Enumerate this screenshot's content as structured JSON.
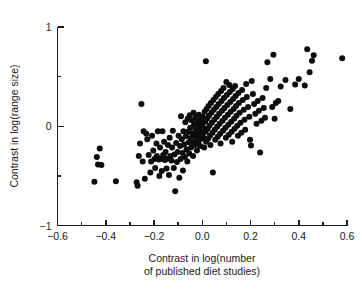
{
  "chart_data": {
    "type": "scatter",
    "title": "",
    "xlabel": "Contrast in log(number of published diet studies)",
    "xlabel_line1": "Contrast in log(number",
    "xlabel_line2": "of published diet studies)",
    "ylabel": "Contrast in log(range size)",
    "xlim": [
      -0.6,
      0.6
    ],
    "ylim": [
      -1,
      1
    ],
    "x_ticks_major": [
      -0.6,
      -0.4,
      -0.2,
      0.0,
      0.2,
      0.4,
      0.6
    ],
    "x_tick_labels": [
      "-0.6",
      "-0.4",
      "-0.2",
      "0.0",
      "0.2",
      "0.4",
      "0.6"
    ],
    "x_ticks_minor": [
      -0.5,
      -0.3,
      -0.1,
      0.1,
      0.3,
      0.5
    ],
    "y_ticks_major": [
      -1,
      0,
      1
    ],
    "y_tick_labels": [
      "-1",
      "0",
      "1"
    ],
    "y_ticks_minor": [
      -0.5,
      0.5
    ],
    "grid": false,
    "legend": false,
    "marker": "filled-circle",
    "marker_color": "#0d0d0d",
    "marker_size_px": 6,
    "point_count": 211,
    "points": [
      [
        -0.447,
        -0.56
      ],
      [
        -0.437,
        -0.31
      ],
      [
        -0.432,
        -0.385
      ],
      [
        -0.425,
        -0.225
      ],
      [
        -0.418,
        -0.39
      ],
      [
        -0.358,
        -0.555
      ],
      [
        -0.272,
        -0.565
      ],
      [
        -0.268,
        -0.6
      ],
      [
        -0.263,
        -0.3
      ],
      [
        -0.258,
        -0.175
      ],
      [
        -0.252,
        0.225
      ],
      [
        -0.247,
        -0.355
      ],
      [
        -0.243,
        -0.05
      ],
      [
        -0.238,
        -0.53
      ],
      [
        -0.232,
        -0.075
      ],
      [
        -0.228,
        -0.13
      ],
      [
        -0.222,
        -0.29
      ],
      [
        -0.215,
        -0.465
      ],
      [
        -0.212,
        -0.355
      ],
      [
        -0.208,
        -0.095
      ],
      [
        -0.203,
        -0.245
      ],
      [
        -0.198,
        -0.33
      ],
      [
        -0.195,
        -0.42
      ],
      [
        -0.19,
        -0.175
      ],
      [
        -0.188,
        -0.3
      ],
      [
        -0.184,
        -0.05
      ],
      [
        -0.18,
        -0.335
      ],
      [
        -0.178,
        -0.5
      ],
      [
        -0.175,
        -0.215
      ],
      [
        -0.172,
        -0.33
      ],
      [
        -0.168,
        -0.45
      ],
      [
        -0.165,
        -0.05
      ],
      [
        -0.162,
        -0.29
      ],
      [
        -0.158,
        -0.155
      ],
      [
        -0.155,
        -0.34
      ],
      [
        -0.152,
        -0.26
      ],
      [
        -0.148,
        -0.425
      ],
      [
        -0.145,
        -0.325
      ],
      [
        -0.142,
        -0.19
      ],
      [
        -0.138,
        -0.49
      ],
      [
        -0.135,
        -0.115
      ],
      [
        -0.132,
        -0.3
      ],
      [
        -0.128,
        -0.345
      ],
      [
        -0.125,
        -0.215
      ],
      [
        -0.122,
        -0.045
      ],
      [
        -0.118,
        -0.42
      ],
      [
        -0.115,
        -0.285
      ],
      [
        -0.112,
        -0.655
      ],
      [
        -0.108,
        -0.17
      ],
      [
        -0.105,
        -0.36
      ],
      [
        -0.102,
        -0.26
      ],
      [
        -0.098,
        -0.095
      ],
      [
        -0.095,
        -0.52
      ],
      [
        -0.092,
        -0.2
      ],
      [
        -0.09,
        -0.33
      ],
      [
        -0.088,
        0.1
      ],
      [
        -0.085,
        -0.13
      ],
      [
        -0.082,
        -0.27
      ],
      [
        -0.08,
        -0.445
      ],
      [
        -0.078,
        -0.05
      ],
      [
        -0.075,
        -0.185
      ],
      [
        -0.072,
        -0.31
      ],
      [
        -0.07,
        0.04
      ],
      [
        -0.068,
        -0.1
      ],
      [
        -0.065,
        -0.235
      ],
      [
        -0.062,
        -0.355
      ],
      [
        -0.06,
        0.075
      ],
      [
        -0.058,
        -0.055
      ],
      [
        -0.056,
        -0.16
      ],
      [
        -0.054,
        -0.275
      ],
      [
        -0.052,
        0.11
      ],
      [
        -0.05,
        -0.015
      ],
      [
        -0.048,
        -0.12
      ],
      [
        -0.046,
        -0.215
      ],
      [
        -0.044,
        0.06
      ],
      [
        -0.042,
        -0.07
      ],
      [
        -0.04,
        -0.165
      ],
      [
        -0.038,
        -0.3
      ],
      [
        -0.036,
        0.135
      ],
      [
        -0.034,
        0.015
      ],
      [
        -0.032,
        -0.09
      ],
      [
        -0.03,
        -0.19
      ],
      [
        -0.028,
        0.085
      ],
      [
        -0.026,
        -0.03
      ],
      [
        -0.024,
        -0.135
      ],
      [
        -0.022,
        -0.245
      ],
      [
        -0.02,
        0.05
      ],
      [
        -0.018,
        -0.06
      ],
      [
        -0.016,
        -0.155
      ],
      [
        -0.014,
        0.115
      ],
      [
        -0.012,
        0.005
      ],
      [
        -0.01,
        -0.095
      ],
      [
        -0.008,
        -0.2
      ],
      [
        -0.006,
        0.065
      ],
      [
        -0.004,
        -0.035
      ],
      [
        -0.002,
        -0.125
      ],
      [
        0.0,
        0.025
      ],
      [
        0.0,
        -0.075
      ],
      [
        0.002,
        0.095
      ],
      [
        0.004,
        -0.015
      ],
      [
        0.006,
        -0.115
      ],
      [
        0.008,
        -0.215
      ],
      [
        0.01,
        0.145
      ],
      [
        0.012,
        0.045
      ],
      [
        0.014,
        -0.055
      ],
      [
        0.016,
        -0.155
      ],
      [
        0.018,
        0.175
      ],
      [
        0.02,
        0.075
      ],
      [
        0.022,
        -0.025
      ],
      [
        0.024,
        -0.125
      ],
      [
        0.026,
        0.205
      ],
      [
        0.028,
        0.105
      ],
      [
        0.03,
        0.005
      ],
      [
        0.032,
        -0.095
      ],
      [
        0.034,
        -0.19
      ],
      [
        0.036,
        0.235
      ],
      [
        0.038,
        0.135
      ],
      [
        0.04,
        0.035
      ],
      [
        0.042,
        -0.065
      ],
      [
        0.044,
        -0.465
      ],
      [
        0.046,
        0.265
      ],
      [
        0.048,
        0.165
      ],
      [
        0.05,
        0.065
      ],
      [
        0.052,
        -0.035
      ],
      [
        0.054,
        -0.135
      ],
      [
        0.056,
        0.295
      ],
      [
        0.058,
        0.195
      ],
      [
        0.06,
        0.095
      ],
      [
        0.062,
        -0.005
      ],
      [
        0.064,
        -0.105
      ],
      [
        0.066,
        0.325
      ],
      [
        0.068,
        0.225
      ],
      [
        0.07,
        0.125
      ],
      [
        0.072,
        0.025
      ],
      [
        0.074,
        -0.075
      ],
      [
        0.076,
        -0.175
      ],
      [
        0.078,
        0.355
      ],
      [
        0.08,
        0.255
      ],
      [
        0.082,
        0.155
      ],
      [
        0.084,
        0.055
      ],
      [
        0.086,
        -0.045
      ],
      [
        0.088,
        0.385
      ],
      [
        0.09,
        0.285
      ],
      [
        0.092,
        0.185
      ],
      [
        0.094,
        0.085
      ],
      [
        0.096,
        -0.015
      ],
      [
        0.098,
        -0.115
      ],
      [
        0.1,
        0.445
      ],
      [
        0.102,
        0.315
      ],
      [
        0.104,
        0.215
      ],
      [
        0.106,
        0.115
      ],
      [
        0.108,
        0.015
      ],
      [
        0.11,
        -0.085
      ],
      [
        0.112,
        0.415
      ],
      [
        0.114,
        0.345
      ],
      [
        0.116,
        0.245
      ],
      [
        0.118,
        0.145
      ],
      [
        0.12,
        0.045
      ],
      [
        0.122,
        -0.055
      ],
      [
        0.124,
        -0.155
      ],
      [
        0.126,
        0.375
      ],
      [
        0.128,
        0.275
      ],
      [
        0.13,
        0.175
      ],
      [
        0.132,
        0.075
      ],
      [
        0.134,
        -0.025
      ],
      [
        0.136,
        0.405
      ],
      [
        0.138,
        0.305
      ],
      [
        0.14,
        0.205
      ],
      [
        0.142,
        0.105
      ],
      [
        0.145,
        0.005
      ],
      [
        0.148,
        -0.095
      ],
      [
        0.15,
        0.335
      ],
      [
        0.152,
        0.235
      ],
      [
        0.155,
        0.135
      ],
      [
        0.158,
        0.035
      ],
      [
        0.162,
        -0.065
      ],
      [
        0.165,
        0.365
      ],
      [
        0.168,
        0.265
      ],
      [
        0.172,
        0.165
      ],
      [
        0.175,
        0.065
      ],
      [
        0.178,
        -0.035
      ],
      [
        0.182,
        0.425
      ],
      [
        0.185,
        0.295
      ],
      [
        0.19,
        0.195
      ],
      [
        0.195,
        0.095
      ],
      [
        0.198,
        -0.135
      ],
      [
        0.202,
        -0.195
      ],
      [
        0.205,
        0.455
      ],
      [
        0.21,
        0.325
      ],
      [
        0.215,
        0.225
      ],
      [
        0.22,
        0.125
      ],
      [
        0.225,
        0.025
      ],
      [
        0.23,
        0.255
      ],
      [
        0.235,
        0.155
      ],
      [
        0.24,
        -0.265
      ],
      [
        0.245,
        0.055
      ],
      [
        0.25,
        0.285
      ],
      [
        0.255,
        0.185
      ],
      [
        0.26,
        0.085
      ],
      [
        0.265,
        0.385
      ],
      [
        0.27,
        0.645
      ],
      [
        0.282,
        0.475
      ],
      [
        0.29,
        0.195
      ],
      [
        0.295,
        0.72
      ],
      [
        0.3,
        0.075
      ],
      [
        0.305,
        0.235
      ],
      [
        0.315,
        0.255
      ],
      [
        0.325,
        0.4
      ],
      [
        0.345,
        0.465
      ],
      [
        0.365,
        0.175
      ],
      [
        0.385,
        0.42
      ],
      [
        0.4,
        0.475
      ],
      [
        0.425,
        0.41
      ],
      [
        0.435,
        0.775
      ],
      [
        0.445,
        0.545
      ],
      [
        0.455,
        0.66
      ],
      [
        0.462,
        0.715
      ],
      [
        0.015,
        0.655
      ],
      [
        0.58,
        0.685
      ]
    ]
  }
}
